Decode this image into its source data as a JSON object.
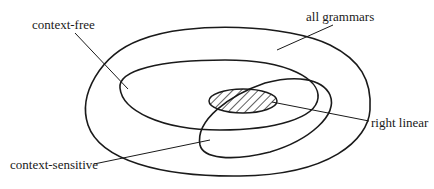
{
  "diagram": {
    "type": "set-inclusion (Venn) diagram",
    "labels": {
      "all_grammars": "all grammars",
      "context_free": "context-free",
      "context_sensitive": "context-sensitive",
      "right_linear": "right linear"
    },
    "regions": [
      {
        "name": "all grammars",
        "shape": "outer closed curve",
        "contains": [
          "context-free",
          "context-sensitive"
        ]
      },
      {
        "name": "context-free",
        "shape": "middle ellipse"
      },
      {
        "name": "context-sensitive",
        "shape": "tilted ellipse overlapping context-free"
      },
      {
        "name": "right linear",
        "shape": "small hatched ellipse",
        "fill": "hatched",
        "within": [
          "context-free",
          "context-sensitive"
        ]
      }
    ],
    "colors": {
      "stroke": "#1a1a1a",
      "background": "#ffffff"
    }
  }
}
